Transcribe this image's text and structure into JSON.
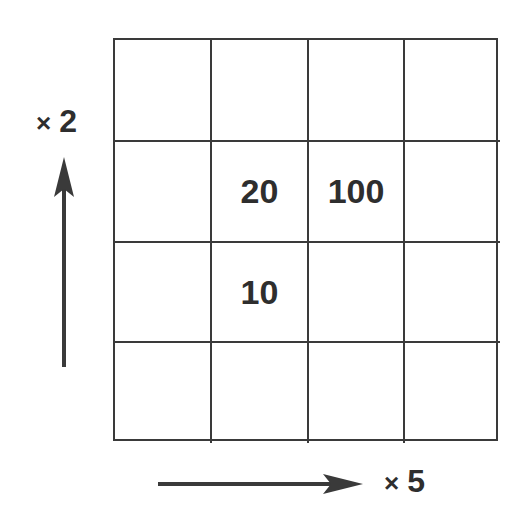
{
  "diagram": {
    "type": "multiplication-grid",
    "rows": 4,
    "columns": 4,
    "cells": [
      [
        "",
        "",
        "",
        ""
      ],
      [
        "",
        "20",
        "100",
        ""
      ],
      [
        "",
        "10",
        "",
        ""
      ],
      [
        "",
        "",
        "",
        ""
      ]
    ],
    "vertical_arrow": {
      "direction": "up",
      "label_symbol": "×",
      "label_value": "2"
    },
    "horizontal_arrow": {
      "direction": "right",
      "label_symbol": "×",
      "label_value": "5"
    },
    "colors": {
      "line": "#3a3a3a",
      "text": "#2e2e2e",
      "background": "#ffffff"
    }
  }
}
